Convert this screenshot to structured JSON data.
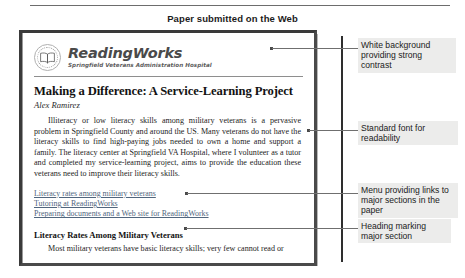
{
  "figure": {
    "caption": "Paper submitted on the Web"
  },
  "document": {
    "masthead": {
      "seal_icon": "open-book-seal-icon",
      "brand_name": "ReadingWorks",
      "brand_subtitle": "Springfield Veterans Administration Hospital"
    },
    "article": {
      "title": "Making a Difference: A Service-Learning Project",
      "byline": "Alex Ramirez",
      "paragraph": "Illiteracy or low literacy skills among military veterans is a pervasive problem in Springfield County and around the US. Many veterans do not have the literacy skills to find high-paying jobs needed to own a home and support a family. The literacy center at Springfield VA Hospital, where I volunteer as a tutor and completed my service-learning project, aims to provide the education these veterans need to improve their literacy skills."
    },
    "link_menu": [
      {
        "label": "Literacy rates among military veterans"
      },
      {
        "label": "Tutoring at ReadingWorks"
      },
      {
        "label": "Preparing documents and a Web site for ReadingWorks"
      }
    ],
    "section": {
      "heading": "Literacy Rates Among Military Veterans",
      "paragraph": "Most military veterans have basic literacy skills; very few cannot read or"
    }
  },
  "annotations": [
    {
      "text": "White background providing strong contrast"
    },
    {
      "text": "Standard font for readability"
    },
    {
      "text": "Menu providing links to major sections in the paper"
    },
    {
      "text": "Heading marking major section"
    }
  ],
  "colors": {
    "link": "#51667e",
    "callout_background": "#ececeb",
    "frame_border": "#3a3a3a",
    "rule": "#6d6d6d"
  }
}
